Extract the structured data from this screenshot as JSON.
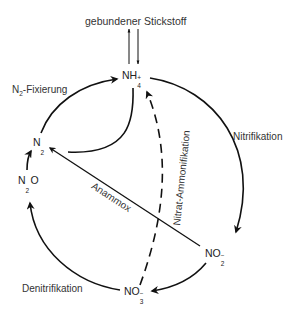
{
  "diagram": {
    "top_label": "gebundener Stickstoff",
    "nodes": {
      "nh4": {
        "base": "NH",
        "sub": "4",
        "sup": "+"
      },
      "n2": {
        "base": "N",
        "sub": "2"
      },
      "n2o": {
        "base": "N",
        "sub": "2",
        "tail": "O"
      },
      "no2": {
        "base": "NO",
        "sub": "2",
        "sup": "−"
      },
      "no3": {
        "base": "NO",
        "sub": "3",
        "sup": "−"
      }
    },
    "processes": {
      "fixation": {
        "prefix": "N",
        "sub": "2",
        "suffix": "-Fixierung"
      },
      "nitrification": "Nitrifikation",
      "denitrification": "Denitrifikation",
      "anammox": "Anammox",
      "nitrate_ammonification": "Nitrat-Ammonifikation"
    },
    "colors": {
      "line": "#111111",
      "text": "#333333"
    }
  }
}
